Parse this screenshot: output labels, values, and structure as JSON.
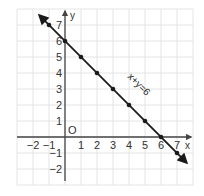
{
  "chart_data": {
    "type": "line",
    "title": "",
    "xlabel": "x",
    "ylabel": "y",
    "xlim": [
      -3,
      8
    ],
    "ylim": [
      -3,
      8
    ],
    "grid": true,
    "origin_label": "O",
    "x_ticks": [
      "-2",
      "-1",
      "1",
      "2",
      "3",
      "4",
      "5",
      "6",
      "7"
    ],
    "y_ticks": [
      "7",
      "6",
      "5",
      "4",
      "3",
      "2",
      "1",
      "-1",
      "-2"
    ],
    "series": [
      {
        "name": "x+y=6",
        "equation": "x + y = 6",
        "x": [
          -1,
          0,
          1,
          2,
          3,
          4,
          5,
          6,
          7
        ],
        "y": [
          7,
          6,
          5,
          4,
          3,
          2,
          1,
          0,
          -1
        ],
        "arrows_both_ends": true
      }
    ],
    "annotations": [
      {
        "text": "x+y=6",
        "x": 3.5,
        "y": 3.5,
        "rotation": 45
      }
    ]
  },
  "colors": {
    "grid": "#e4e4e4",
    "axis": "#444444",
    "line": "#1a1a1a"
  }
}
